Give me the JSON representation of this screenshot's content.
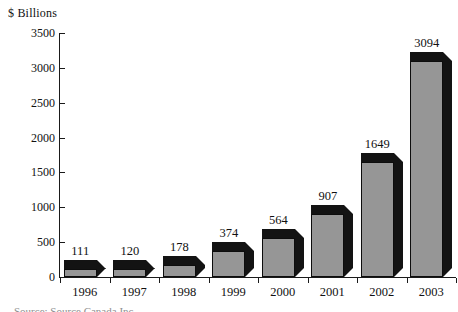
{
  "chart_data": {
    "type": "bar",
    "title": "",
    "subtitle": "",
    "xlabel": "",
    "ylabel": "$ Billions",
    "categories": [
      "1996",
      "1997",
      "1998",
      "1999",
      "2000",
      "2001",
      "2002",
      "2003"
    ],
    "values": [
      111,
      120,
      178,
      374,
      564,
      907,
      1649,
      3094
    ],
    "data_labels": [
      "111",
      "120",
      "178",
      "374",
      "564",
      "907",
      "1649",
      "3094"
    ],
    "ylim": [
      0,
      3500
    ],
    "y_ticks": [
      0,
      500,
      1000,
      1500,
      2000,
      2500,
      3000,
      3500
    ],
    "y_tick_labels": [
      "0",
      "500",
      "1000",
      "1500",
      "2000",
      "2500",
      "3000",
      "3500"
    ],
    "grid": false,
    "legend": false,
    "legend_position": "none",
    "style": "3d-column",
    "series": [
      {
        "name": "",
        "values": [
          111,
          120,
          178,
          374,
          564,
          907,
          1649,
          3094
        ]
      }
    ]
  },
  "colors": {
    "bar_front": "#969696",
    "bar_shade": "#131313",
    "bar_outline": "#0d0d0d",
    "axis": "#1a1a1a",
    "text": "#111111",
    "background": "#ffffff"
  },
  "caption": {
    "clipped_text": "Source: Source Canada Inc."
  }
}
